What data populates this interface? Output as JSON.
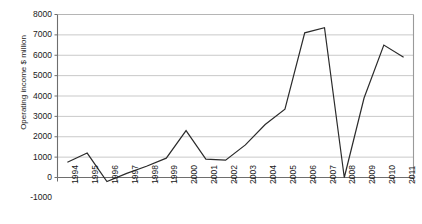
{
  "chart_data": {
    "type": "line",
    "title": "",
    "xlabel": "",
    "ylabel": "Operating income $ million",
    "categories": [
      "1994",
      "1995",
      "1996",
      "1997",
      "1998",
      "1999",
      "2000",
      "2001",
      "2002",
      "2003",
      "2004",
      "2005",
      "2006",
      "2007",
      "2008",
      "2009",
      "2010",
      "2011"
    ],
    "values": [
      750,
      1200,
      -200,
      200,
      550,
      950,
      2300,
      900,
      850,
      1600,
      2600,
      3350,
      7100,
      7350,
      0,
      3900,
      6500,
      5900
    ],
    "series": [
      {
        "name": "Operating income",
        "values": [
          750,
          1200,
          -200,
          200,
          550,
          950,
          2300,
          900,
          850,
          1600,
          2600,
          3350,
          7100,
          7350,
          0,
          3900,
          6500,
          5900
        ]
      }
    ],
    "ylim": [
      -1000,
      8000
    ],
    "ytick_labels": [
      "8000",
      "7000",
      "6000",
      "5000",
      "4000",
      "3000",
      "2000",
      "1000",
      "0",
      "-1000"
    ],
    "ytick_values": [
      8000,
      7000,
      6000,
      5000,
      4000,
      3000,
      2000,
      1000,
      0,
      -1000
    ],
    "xtick_labels": [
      "1994",
      "1995",
      "1996",
      "1997",
      "1998",
      "1999",
      "2000",
      "2001",
      "2002",
      "2003",
      "2004",
      "2005",
      "2006",
      "2007",
      "2008",
      "2009",
      "2010",
      "2011"
    ],
    "grid": true,
    "grid_axis": "y",
    "legend": false,
    "legend_position": "none",
    "line_color": "#2b2b2b",
    "grid_color": "#c9c9c9",
    "axis_color": "#808080",
    "background_color": "#ffffff"
  }
}
